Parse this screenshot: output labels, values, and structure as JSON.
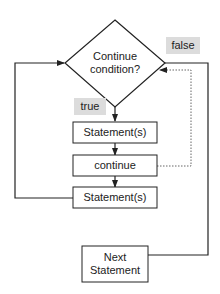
{
  "diagram": {
    "type": "flowchart",
    "decision": {
      "line1": "Continue",
      "line2": "condition?"
    },
    "labels": {
      "true": "true",
      "false": "false"
    },
    "boxes": {
      "statement_1": "Statement(s)",
      "continue": "continue",
      "statement_2": "Statement(s)",
      "next_line1": "Next",
      "next_line2": "Statement"
    },
    "colors": {
      "stroke": "#222222",
      "tag_bg": "#dcdcdc",
      "dotted": "#666666"
    }
  }
}
